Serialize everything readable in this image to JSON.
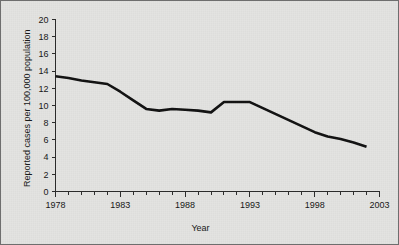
{
  "figure": {
    "background_color": "#e3e3e1",
    "border_color": "#6e6e6e",
    "line_color": "#111111"
  },
  "chart_data": {
    "type": "line",
    "title": "",
    "subtitle": "",
    "xlabel": "Year",
    "ylabel": "Reported cases per 100,000 population",
    "xlim": [
      1978,
      2003
    ],
    "ylim": [
      0,
      20
    ],
    "grid": false,
    "legend": null,
    "x_tick_labels": [
      "1978",
      "1983",
      "1988",
      "1993",
      "1998",
      "2003"
    ],
    "x_tick_values": [
      1978,
      1983,
      1988,
      1993,
      1998,
      2003
    ],
    "x_minor_tick_interval": 1,
    "y_tick_labels": [
      "0",
      "2",
      "4",
      "6",
      "8",
      "10",
      "12",
      "14",
      "16",
      "18",
      "20"
    ],
    "y_tick_values": [
      0,
      2,
      4,
      6,
      8,
      10,
      12,
      14,
      16,
      18,
      20
    ],
    "series": [
      {
        "name": "Reported cases per 100,000 population",
        "color": "#111111",
        "x": [
          1978,
          1979,
          1980,
          1981,
          1982,
          1983,
          1984,
          1985,
          1986,
          1987,
          1988,
          1989,
          1990,
          1991,
          1992,
          1993,
          1994,
          1995,
          1996,
          1997,
          1998,
          1999,
          2000,
          2001,
          2002
        ],
        "values": [
          13.4,
          13.2,
          12.9,
          12.7,
          12.5,
          11.6,
          10.6,
          9.6,
          9.4,
          9.6,
          9.5,
          9.4,
          9.2,
          10.4,
          10.4,
          10.4,
          9.7,
          9.0,
          8.3,
          7.6,
          6.9,
          6.4,
          6.1,
          5.7,
          5.2
        ]
      }
    ]
  }
}
